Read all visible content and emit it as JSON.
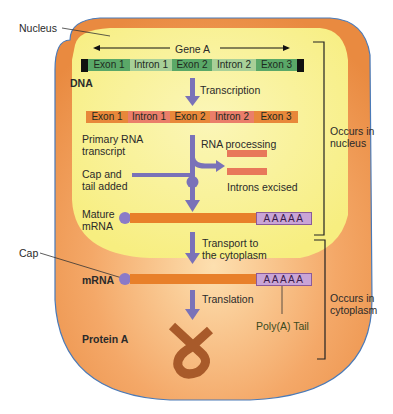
{
  "labels": {
    "nucleus": "Nucleus",
    "gene": "Gene A",
    "dna": "DNA",
    "transcription": "Transcription",
    "primary_rna_1": "Primary RNA",
    "primary_rna_2": "transcript",
    "rna_processing": "RNA processing",
    "cap_tail_1": "Cap and",
    "cap_tail_2": "tail added",
    "introns_excised": "Introns excised",
    "mature_1": "Mature",
    "mature_2": "mRNA",
    "transport_1": "Transport to",
    "transport_2": "the cytoplasm",
    "cap": "Cap",
    "mrna": "mRNA",
    "translation": "Translation",
    "protein": "Protein A",
    "polya_tail": "Poly(A) Tail",
    "occurs_nucleus_1": "Occurs in",
    "occurs_nucleus_2": "nucleus",
    "occurs_cyto_1": "Occurs in",
    "occurs_cyto_2": "cytoplasm"
  },
  "dna_segments": [
    {
      "label": "Exon 1",
      "type": "exon"
    },
    {
      "label": "Intron 1",
      "type": "intron"
    },
    {
      "label": "Exon 2",
      "type": "exon"
    },
    {
      "label": "Intron 2",
      "type": "intron"
    },
    {
      "label": "Exon 3",
      "type": "exon"
    }
  ],
  "rna_segments": [
    {
      "label": "Exon 1",
      "type": "exon"
    },
    {
      "label": "Intron 1",
      "type": "intron"
    },
    {
      "label": "Exon 2",
      "type": "exon"
    },
    {
      "label": "Intron 2",
      "type": "intron"
    },
    {
      "label": "Exon 3",
      "type": "exon"
    }
  ],
  "polya": "AAAAA",
  "colors": {
    "cytoplasm": "#f0a060",
    "nucleus": "#f8f090",
    "dna_exon": "#5aa868",
    "dna_intron": "#9cc88a",
    "rna_exon": "#e8883a",
    "rna_intron": "#e87a68",
    "arrow": "#7a72b8",
    "protein": "#a85a2a"
  }
}
